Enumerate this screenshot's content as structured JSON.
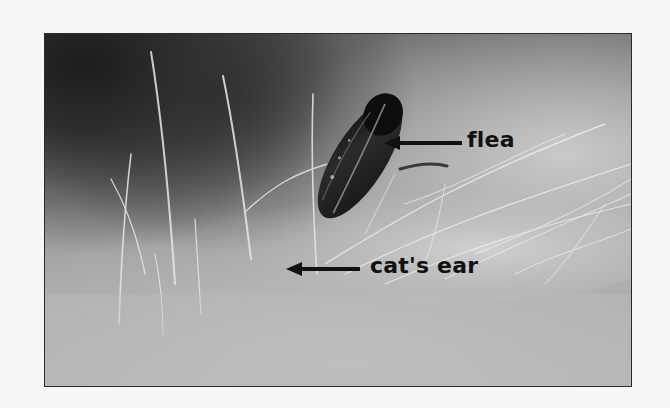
{
  "photo": {
    "subject": "flea in cat fur",
    "tone": "grayscale",
    "colors": {
      "page_background": "#f6f6f6",
      "frame_border": "#2a2a2a",
      "label_text": "#111111",
      "flea_body": "#1a1a1a"
    }
  },
  "annotations": [
    {
      "label": "flea",
      "arrow_direction": "left",
      "points_to": "flea"
    },
    {
      "label": "cat's ear",
      "arrow_direction": "left",
      "points_to": "cat fur"
    }
  ]
}
